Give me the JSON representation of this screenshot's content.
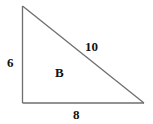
{
  "figure": {
    "type": "right-triangle",
    "region_label": "B",
    "sides": {
      "vertical_leg": "6",
      "horizontal_leg": "8",
      "hypotenuse": "10"
    }
  },
  "colors": {
    "line": "#6e6e6e",
    "text": "#111111",
    "background": "#ffffff"
  }
}
